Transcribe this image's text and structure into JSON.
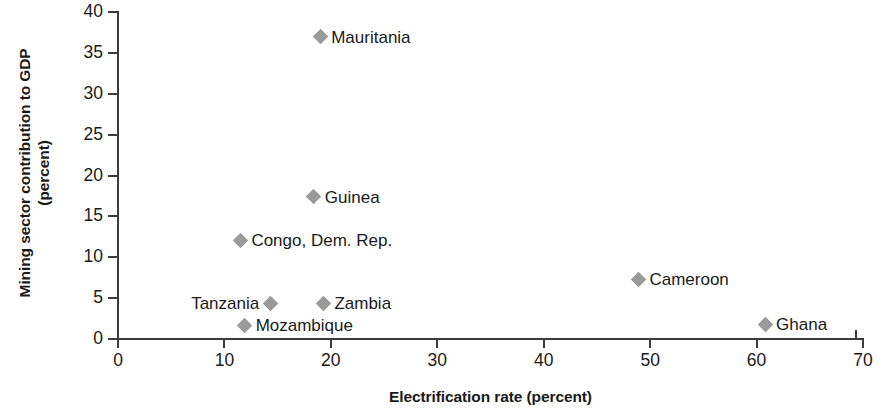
{
  "chart_data": {
    "type": "scatter",
    "title": "",
    "xlabel": "Electrification rate (percent)",
    "ylabel_line1": "Mining sector contribution to GDP",
    "ylabel_line2": "(percent)",
    "xlim": [
      0,
      70
    ],
    "ylim": [
      0,
      40
    ],
    "xticks": [
      "0",
      "10",
      "20",
      "30",
      "40",
      "50",
      "60",
      "70"
    ],
    "yticks": [
      "0",
      "5",
      "10",
      "15",
      "20",
      "25",
      "30",
      "35",
      "40"
    ],
    "grid": false,
    "legend": "none",
    "marker": "diamond",
    "marker_color": "#9a9a9a",
    "axis_color": "#3b3b3b",
    "points": [
      {
        "label": "Mauritania",
        "x": 19.0,
        "y": 37.0,
        "label_side": "right"
      },
      {
        "label": "Guinea",
        "x": 18.4,
        "y": 17.4,
        "label_side": "right"
      },
      {
        "label": "Congo, Dem. Rep.",
        "x": 11.5,
        "y": 12.1,
        "label_side": "right"
      },
      {
        "label": "Tanzania",
        "x": 14.3,
        "y": 4.4,
        "label_side": "left"
      },
      {
        "label": "Zambia",
        "x": 19.3,
        "y": 4.4,
        "label_side": "right"
      },
      {
        "label": "Mozambique",
        "x": 11.9,
        "y": 1.7,
        "label_side": "right"
      },
      {
        "label": "Cameroon",
        "x": 48.9,
        "y": 7.3,
        "label_side": "right"
      },
      {
        "label": "Ghana",
        "x": 60.8,
        "y": 1.8,
        "label_side": "right"
      }
    ]
  }
}
